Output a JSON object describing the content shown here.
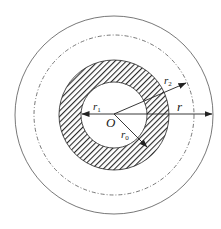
{
  "diagram": {
    "title": "",
    "colors": {
      "line": "#333333",
      "hatch": "#2a2a2a",
      "background": "#ffffff"
    },
    "circles": [
      {
        "name": "outer-circle",
        "style": "solid"
      },
      {
        "name": "reference-circle",
        "style": "dash-dot"
      },
      {
        "name": "annulus-outer-boundary",
        "style": "solid"
      },
      {
        "name": "annulus-inner-boundary",
        "style": "solid"
      }
    ],
    "annulus": {
      "fill": "diagonal-hatch"
    },
    "labels": {
      "center": "O",
      "r1": {
        "base": "r",
        "sub": "1"
      },
      "r2": {
        "base": "r",
        "sub": "2"
      },
      "r0": {
        "base": "r",
        "sub": "0"
      },
      "r": {
        "base": "r",
        "sub": ""
      }
    },
    "arrows": [
      {
        "name": "r1-arrow",
        "label": "r1",
        "direction": "left",
        "to": "annulus-inner-boundary"
      },
      {
        "name": "r2-arrow",
        "label": "r2",
        "direction": "upper-right",
        "to": "reference-circle"
      },
      {
        "name": "r0-arrow",
        "label": "r0",
        "direction": "lower-right",
        "to": "inside-annulus"
      },
      {
        "name": "r-arrow",
        "label": "r",
        "direction": "right",
        "to": "outer-circle"
      }
    ]
  }
}
